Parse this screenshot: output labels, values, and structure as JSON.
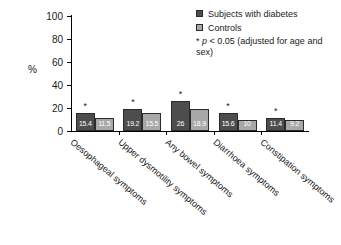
{
  "chart_data": {
    "type": "bar",
    "title": "",
    "xlabel": "",
    "ylabel": "%",
    "ylim": [
      0,
      100
    ],
    "yticks": [
      0,
      20,
      40,
      60,
      80,
      100
    ],
    "grid": false,
    "legend_position": "top-right",
    "categories": [
      "Oesophageal symptoms",
      "Upper dysmotility symptoms",
      "Any bowel symptoms",
      "Diarrhoea symptoms",
      "Constipation symptoms"
    ],
    "series": [
      {
        "name": "Subjects with diabetes",
        "color": "#4d4d4d",
        "values": [
          15.4,
          19.2,
          26,
          15.6,
          11.4
        ],
        "value_labels": [
          "15.4",
          "19.2",
          "26",
          "15.6",
          "11.4"
        ],
        "significance": [
          "*",
          "*",
          "*",
          "*",
          "*"
        ]
      },
      {
        "name": "Controls",
        "color": "#a8a8a8",
        "values": [
          11.5,
          15.5,
          18.9,
          10,
          9.2
        ],
        "value_labels": [
          "11.5",
          "15.5",
          "18.9",
          "10",
          "9.2"
        ],
        "significance": [
          "",
          "",
          "",
          "",
          ""
        ]
      }
    ],
    "annotations": {
      "significance_note_marker": "*",
      "significance_note_p": "p",
      "significance_note_rest": "< 0.05 (adjusted for age and sex)"
    }
  }
}
